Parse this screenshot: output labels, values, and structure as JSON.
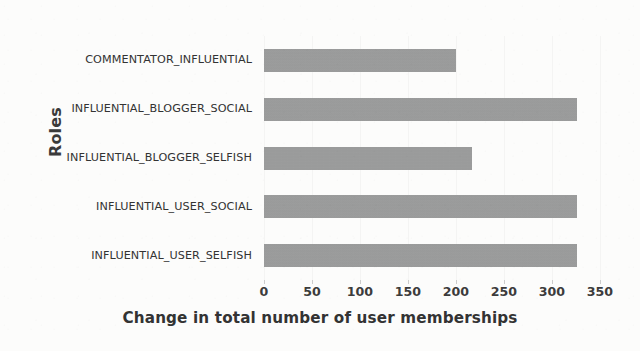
{
  "chart_data": {
    "type": "bar",
    "orientation": "horizontal",
    "title": "",
    "xlabel": "Change in total number of user memberships",
    "ylabel": "Roles",
    "categories": [
      "INFLUENTIAL_USER_SELFISH",
      "INFLUENTIAL_USER_SOCIAL",
      "INFLUENTIAL_BLOGGER_SELFISH",
      "INFLUENTIAL_BLOGGER_SOCIAL",
      "COMMENTATOR_INFLUENTIAL"
    ],
    "values": [
      326,
      326,
      217,
      326,
      200
    ],
    "xlim": [
      0,
      350
    ],
    "xticks": [
      0,
      50,
      100,
      150,
      200,
      250,
      300,
      350
    ],
    "xtick_labels": [
      "0",
      "50",
      "100",
      "150",
      "200",
      "250",
      "300",
      "350"
    ],
    "grid": false,
    "legend": null,
    "bar_color": "#9b9c9c",
    "background_color": "#fcfcfb",
    "text_color": "#333333"
  },
  "axis": {
    "y_title": "Roles",
    "x_title": "Change in total number of user memberships"
  }
}
